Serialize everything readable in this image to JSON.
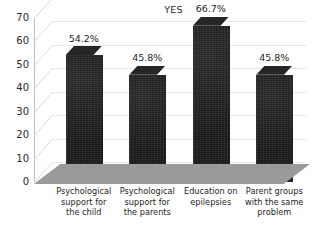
{
  "chart_data": {
    "type": "bar",
    "title": "YES",
    "xlabel": "",
    "ylabel": "",
    "categories": [
      "Psychological support for the child",
      "Psychological support for the parents",
      "Education on epilepsies",
      "Parent groups with the same problem"
    ],
    "category_lines": [
      [
        "Psychological",
        "support for",
        "the child"
      ],
      [
        "Psychological",
        "support for",
        "the parents"
      ],
      [
        "Education on",
        "epilepsies"
      ],
      [
        "Parent groups",
        "with the same",
        "problem"
      ]
    ],
    "values": [
      54.2,
      45.8,
      66.7,
      45.8
    ],
    "data_labels": [
      "54.2%",
      "45.8%",
      "66.7%",
      "45.8%"
    ],
    "ylim": [
      0,
      70
    ],
    "ytick_values": [
      0,
      10,
      20,
      30,
      40,
      50,
      60,
      70
    ],
    "ytick_labels": [
      "0",
      "10",
      "20",
      "30",
      "40",
      "50",
      "60",
      "70"
    ],
    "grid": true,
    "legend": false,
    "legend_position": "none",
    "style": "3d-column",
    "colors": {
      "bar_fill": "#181818",
      "bar_top": "#262626",
      "floor": "#9a9a9a",
      "gridline": "#e8e8e8",
      "axis": "#bdbdbd",
      "text": "#1d1d1d",
      "background": "#ffffff"
    }
  }
}
